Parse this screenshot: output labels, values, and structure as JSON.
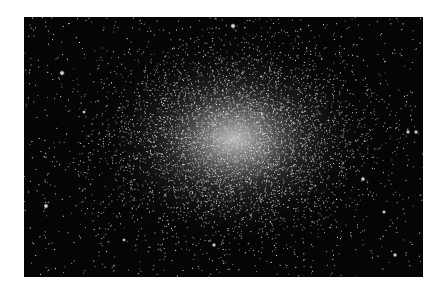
{
  "image": {
    "subject": "globular star cluster",
    "width": 399,
    "height": 260,
    "background_color": "#050505",
    "core": {
      "cx": 210,
      "cy": 122,
      "rx": 150,
      "ry": 110,
      "core_color": "#e8e8e8"
    },
    "field_star_count": 900,
    "cluster_star_count": 5200,
    "bright_stars": [
      {
        "x": 209,
        "y": 9,
        "r": 1.6
      },
      {
        "x": 38,
        "y": 56,
        "r": 1.6
      },
      {
        "x": 22,
        "y": 189,
        "r": 1.5
      },
      {
        "x": 339,
        "y": 162,
        "r": 1.4
      },
      {
        "x": 384,
        "y": 115,
        "r": 1.3
      },
      {
        "x": 392,
        "y": 115,
        "r": 1.3
      },
      {
        "x": 190,
        "y": 228,
        "r": 1.3
      },
      {
        "x": 371,
        "y": 238,
        "r": 1.3
      },
      {
        "x": 360,
        "y": 195,
        "r": 1.2
      },
      {
        "x": 60,
        "y": 95,
        "r": 1.1
      },
      {
        "x": 100,
        "y": 223,
        "r": 1.1
      }
    ]
  }
}
